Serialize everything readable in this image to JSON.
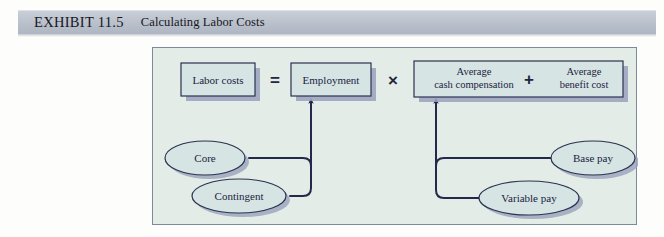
{
  "header": {
    "exhibit_label": "EXHIBIT 11.5",
    "title": "Calculating Labor Costs",
    "band_color": "#b9c0cb"
  },
  "diagram": {
    "panel_bg": "#e3ece6",
    "panel_border": "#7d8a99",
    "node_fill": "#ccdbdc",
    "node_stroke": "#2b3350",
    "shadow_color": "#8a90ad",
    "boxes": [
      {
        "id": "labor-costs",
        "label": "Labor costs"
      },
      {
        "id": "employment",
        "label": "Employment"
      },
      {
        "id": "average-cash-compensation",
        "label_line1": "Average",
        "label_line2": "cash compensation"
      },
      {
        "id": "average-benefit-cost",
        "label_line1": "Average",
        "label_line2": "benefit cost"
      }
    ],
    "operators": [
      {
        "id": "equals",
        "symbol": "="
      },
      {
        "id": "times",
        "symbol": "×"
      },
      {
        "id": "plus",
        "symbol": "+"
      }
    ],
    "ellipses": [
      {
        "id": "core",
        "label": "Core"
      },
      {
        "id": "contingent",
        "label": "Contingent"
      },
      {
        "id": "base-pay",
        "label": "Base pay"
      },
      {
        "id": "variable-pay",
        "label": "Variable pay"
      }
    ]
  }
}
